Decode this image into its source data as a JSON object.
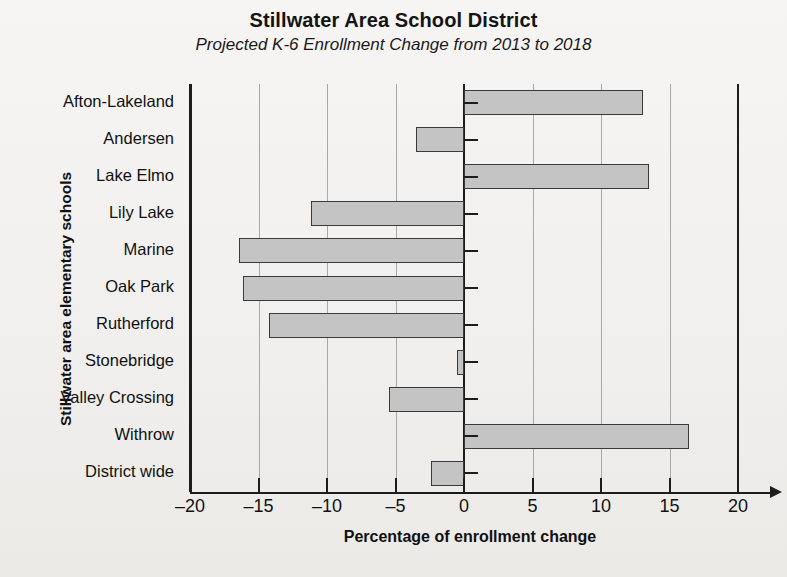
{
  "chart_data": {
    "type": "bar",
    "orientation": "horizontal",
    "title": "Stillwater Area School District",
    "subtitle": "Projected K-6 Enrollment Change from 2013 to 2018",
    "xlabel": "Percentage of enrollment change",
    "ylabel": "Stillwater area elementary schools",
    "categories": [
      "Afton-Lakeland",
      "Andersen",
      "Lake Elmo",
      "Lily Lake",
      "Marine",
      "Oak Park",
      "Rutherford",
      "Stonebridge",
      "Valley Crossing",
      "Withrow",
      "District wide"
    ],
    "values": [
      13.1,
      -3.5,
      13.5,
      -11.2,
      -16.4,
      -16.1,
      -14.2,
      -0.5,
      -5.5,
      16.4,
      -2.4
    ],
    "xlim": [
      -20,
      20
    ],
    "xticks": [
      -20,
      -15,
      -10,
      -5,
      0,
      5,
      10,
      15,
      20
    ],
    "xtick_labels": [
      "–20",
      "–15",
      "–10",
      "–5",
      "0",
      "5",
      "10",
      "15",
      "20"
    ],
    "grid": true,
    "grid_axis": "x",
    "legend": null,
    "bar_fill_color": "#c4c4c4",
    "bar_edge_color": "#3a3a3a",
    "background_color": "#f1f0ee"
  },
  "footer": {
    "note": ""
  }
}
